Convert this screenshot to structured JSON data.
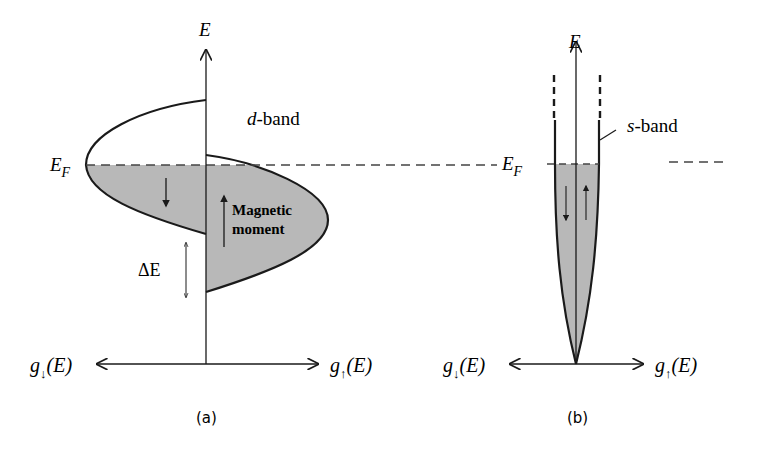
{
  "panel_a": {
    "axis_label": "E",
    "fermi_label_main": "E",
    "fermi_label_sub": "F",
    "band_label_italic": "d",
    "band_label_rest": "-band",
    "moment_line1": "Magnetic",
    "moment_line2": "moment",
    "delta_label": "ΔE",
    "g_down_main": "g",
    "g_down_sub": "↓",
    "g_down_arg": "(E)",
    "g_up_main": "g",
    "g_up_sub": "↑",
    "g_up_arg": "(E)",
    "caption": "(a)"
  },
  "panel_b": {
    "axis_label": "E",
    "fermi_label_main": "E",
    "fermi_label_sub": "F",
    "band_label_italic": "s",
    "band_label_rest": "-band",
    "g_down_main": "g",
    "g_down_sub": "↓",
    "g_down_arg": "(E)",
    "g_up_main": "g",
    "g_up_sub": "↑",
    "g_up_arg": "(E)",
    "caption": "(b)"
  },
  "colors": {
    "fill": "#b8b8b8",
    "stroke": "#1a1a1a",
    "dash": "#444444"
  }
}
